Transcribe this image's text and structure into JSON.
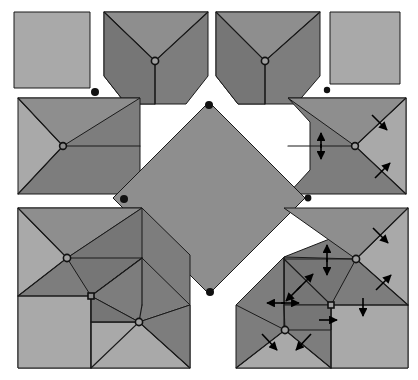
{
  "figure": {
    "width": 418,
    "height": 380,
    "background_color": "#ffffff"
  },
  "colors": {
    "paper_light": "#a9a9a9",
    "paper_mid": "#8e8e8e",
    "paper_dark": "#7d7d7d",
    "paper_darker": "#767676",
    "outline": "#1a1a1a",
    "arrow": "#000000",
    "vertex_fill": "#a0a0a0",
    "dot": "#111111"
  },
  "panels": [
    {
      "id": "panel-top-left",
      "label": "flat square",
      "stage": 1,
      "has_arrows": false,
      "bbox": [
        14,
        12,
        76,
        76
      ]
    },
    {
      "id": "panel-top-center-left",
      "label": "first fold pentagon",
      "stage": 2,
      "has_arrows": false,
      "bbox": [
        104,
        12,
        104,
        92
      ]
    },
    {
      "id": "panel-top-center-right",
      "label": "first fold pentagon mirrored",
      "stage": 3,
      "has_arrows": false,
      "bbox": [
        216,
        12,
        104,
        92
      ]
    },
    {
      "id": "panel-top-right",
      "label": "flat square",
      "stage": 4,
      "has_arrows": false,
      "bbox": [
        330,
        12,
        70,
        72
      ]
    },
    {
      "id": "panel-mid-left",
      "label": "chevron fold",
      "stage": 5,
      "has_arrows": false,
      "bbox": [
        18,
        98,
        122,
        96
      ]
    },
    {
      "id": "panel-mid-right",
      "label": "chevron fold with motion arrows",
      "stage": 6,
      "has_arrows": true,
      "arrow_count": 4,
      "bbox": [
        288,
        98,
        118,
        96
      ]
    },
    {
      "id": "panel-center-diamond",
      "label": "completed square twist",
      "stage": 9,
      "has_arrows": false,
      "bbox": [
        113,
        102,
        192,
        192
      ]
    },
    {
      "id": "panel-bottom-left",
      "label": "double chevron fold",
      "stage": 7,
      "has_arrows": false,
      "bbox": [
        18,
        208,
        172,
        160
      ]
    },
    {
      "id": "panel-bottom-right",
      "label": "double chevron fold with motion arrows",
      "stage": 8,
      "has_arrows": true,
      "arrow_count": 11,
      "bbox": [
        236,
        208,
        172,
        160
      ]
    }
  ],
  "corner_dots": [
    {
      "name": "dot-upper-left-gap",
      "x": 95,
      "y": 92,
      "r": 4
    },
    {
      "name": "dot-upper-right-gap",
      "x": 327,
      "y": 90,
      "r": 3.2
    },
    {
      "name": "dot-diamond-top",
      "x": 209,
      "y": 105,
      "r": 4
    },
    {
      "name": "dot-diamond-left",
      "x": 124,
      "y": 199,
      "r": 4
    },
    {
      "name": "dot-diamond-right",
      "x": 308,
      "y": 198,
      "r": 3.4
    },
    {
      "name": "dot-diamond-bottom",
      "x": 210,
      "y": 292,
      "r": 4
    }
  ],
  "vertex_dots": [
    {
      "name": "vertex-top-center-left",
      "x": 155,
      "y": 61
    },
    {
      "name": "vertex-top-center-right",
      "x": 265,
      "y": 61
    },
    {
      "name": "vertex-mid-left",
      "x": 63,
      "y": 146
    },
    {
      "name": "vertex-mid-right",
      "x": 355,
      "y": 146
    },
    {
      "name": "vertex-bottom-left-upper",
      "x": 67,
      "y": 258
    },
    {
      "name": "vertex-bottom-left-lower",
      "x": 139,
      "y": 322
    },
    {
      "name": "vertex-bottom-right-upper",
      "x": 356,
      "y": 259
    },
    {
      "name": "vertex-bottom-right-lower",
      "x": 285,
      "y": 330
    }
  ],
  "square_vertices": [
    {
      "name": "square-vertex-bottom-left",
      "x": 91,
      "y": 296
    },
    {
      "name": "square-vertex-bottom-right",
      "x": 331,
      "y": 305
    }
  ],
  "arrows": {
    "mid_right": [
      {
        "name": "arrow-mid-right-up",
        "x1": 321,
        "y1": 148,
        "x2": 321,
        "y2": 133
      },
      {
        "name": "arrow-mid-right-down",
        "x1": 321,
        "y1": 144,
        "x2": 321,
        "y2": 159
      },
      {
        "name": "arrow-mid-right-ne-down",
        "x1": 372,
        "y1": 115,
        "x2": 387,
        "y2": 130
      },
      {
        "name": "arrow-mid-right-se-up",
        "x1": 375,
        "y1": 178,
        "x2": 390,
        "y2": 163
      }
    ],
    "bottom_right": [
      {
        "name": "arrow-br-up",
        "x1": 327,
        "y1": 262,
        "x2": 327,
        "y2": 245
      },
      {
        "name": "arrow-br-down",
        "x1": 327,
        "y1": 258,
        "x2": 327,
        "y2": 275
      },
      {
        "name": "arrow-br-ne-down",
        "x1": 373,
        "y1": 228,
        "x2": 388,
        "y2": 243
      },
      {
        "name": "arrow-br-se-up",
        "x1": 376,
        "y1": 290,
        "x2": 391,
        "y2": 275
      },
      {
        "name": "arrow-br-right-down",
        "x1": 363,
        "y1": 298,
        "x2": 363,
        "y2": 316
      },
      {
        "name": "arrow-br-diag-up",
        "x1": 297,
        "y1": 290,
        "x2": 313,
        "y2": 274
      },
      {
        "name": "arrow-br-diag-down",
        "x1": 301,
        "y1": 286,
        "x2": 286,
        "y2": 301
      },
      {
        "name": "arrow-br-left",
        "x1": 285,
        "y1": 303,
        "x2": 267,
        "y2": 303
      },
      {
        "name": "arrow-br-right",
        "x1": 281,
        "y1": 303,
        "x2": 299,
        "y2": 303
      },
      {
        "name": "arrow-br-lower-sw",
        "x1": 262,
        "y1": 334,
        "x2": 277,
        "y2": 350
      },
      {
        "name": "arrow-br-lower-se",
        "x1": 311,
        "y1": 334,
        "x2": 296,
        "y2": 350
      },
      {
        "name": "arrow-br-lower-right",
        "x1": 319,
        "y1": 320,
        "x2": 337,
        "y2": 320
      }
    ]
  }
}
